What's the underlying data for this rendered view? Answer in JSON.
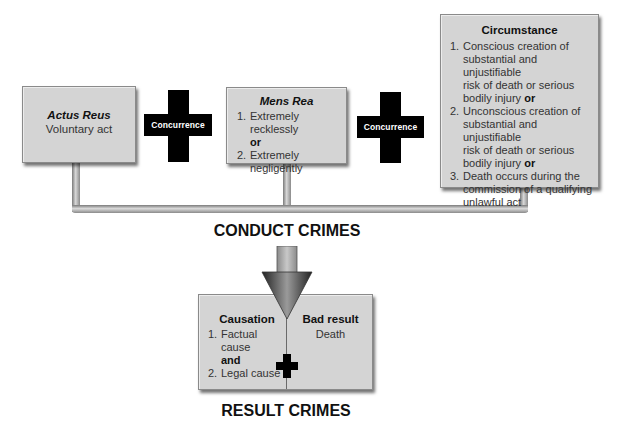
{
  "conduct": {
    "actus_reus": {
      "title": "Actus Reus",
      "text": "Voluntary act"
    },
    "concurrence_1": {
      "label": "Concurrence"
    },
    "mens_rea": {
      "title": "Mens Rea",
      "items": [
        {
          "num": "1.",
          "text": "Extremely recklessly"
        },
        {
          "num": "2.",
          "text": "Extremely negligently"
        }
      ],
      "connector": "or"
    },
    "concurrence_2": {
      "label": "Concurrence"
    },
    "circumstance": {
      "title": "Circumstance",
      "items": [
        {
          "num": "1.",
          "lines": [
            "Conscious creation of",
            "substantial and unjustifiable",
            "risk of death or serious",
            "bodily injury"
          ],
          "suffix": "or"
        },
        {
          "num": "2.",
          "lines": [
            "Unconscious creation of",
            "substantial and unjustifiable",
            "risk of death or serious",
            "bodily injury"
          ],
          "suffix": "or"
        },
        {
          "num": "3.",
          "lines": [
            "Death occurs during the",
            "commission of a qualifying",
            "unlawful act"
          ],
          "suffix": ""
        }
      ]
    },
    "heading": "CONDUCT CRIMES"
  },
  "result": {
    "causation": {
      "title": "Causation",
      "items": [
        {
          "num": "1.",
          "text": "Factual cause"
        },
        {
          "num": "2.",
          "text": "Legal cause"
        }
      ],
      "connector": "and"
    },
    "bad_result": {
      "title": "Bad result",
      "text": "Death"
    },
    "heading": "RESULT CRIMES"
  },
  "colors": {
    "box": "#d4d4d4",
    "cross": "#000000",
    "pipe": "#a8a8a8",
    "arrow": "#555555"
  }
}
